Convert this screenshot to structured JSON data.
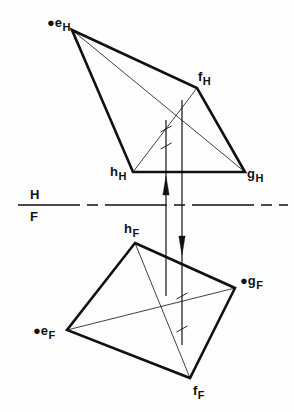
{
  "figure": {
    "kind": "descriptive-geometry-orthographic-projection",
    "background_color": "#fefefe",
    "ink_color": "#111111",
    "fold_line": {
      "upper_label": "H",
      "lower_label": "F",
      "style": "dash-dot",
      "y": 205,
      "x_start": 18,
      "x_end": 288
    },
    "top_view": {
      "name": "horizontal-projection",
      "vertices": [
        {
          "id": "e",
          "label_base": "e",
          "label_sub": "H",
          "marker": "●",
          "x": 72,
          "y": 30,
          "label_x": 47,
          "label_y": 14,
          "has_dot": true
        },
        {
          "id": "f",
          "label_base": "f",
          "label_sub": "H",
          "marker": "",
          "x": 197,
          "y": 88,
          "label_x": 198,
          "label_y": 68,
          "has_dot": false
        },
        {
          "id": "g",
          "label_base": "g",
          "label_sub": "H",
          "marker": "",
          "x": 245,
          "y": 172,
          "label_x": 247,
          "label_y": 165,
          "has_dot": false
        },
        {
          "id": "h",
          "label_base": "h",
          "label_sub": "H",
          "marker": "",
          "x": 133,
          "y": 172,
          "label_x": 110,
          "label_y": 163,
          "has_dot": false
        }
      ],
      "outline_order": [
        "e",
        "f",
        "g",
        "h"
      ],
      "diagonals": [
        [
          "e",
          "g"
        ],
        [
          "f",
          "h"
        ]
      ]
    },
    "front_view": {
      "name": "frontal-projection",
      "vertices": [
        {
          "id": "h",
          "label_base": "h",
          "label_sub": "F",
          "marker": "",
          "x": 135,
          "y": 243,
          "label_x": 124,
          "label_y": 220,
          "has_dot": false
        },
        {
          "id": "g",
          "label_base": "g",
          "label_sub": "F",
          "marker": "●",
          "x": 235,
          "y": 288,
          "label_x": 240,
          "label_y": 272,
          "has_dot": true
        },
        {
          "id": "f",
          "label_base": "f",
          "label_sub": "F",
          "marker": "",
          "x": 190,
          "y": 378,
          "label_x": 193,
          "label_y": 382,
          "has_dot": false
        },
        {
          "id": "e",
          "label_base": "e",
          "label_sub": "F",
          "marker": "●",
          "x": 67,
          "y": 330,
          "label_x": 33,
          "label_y": 322,
          "has_dot": true
        }
      ],
      "outline_order": [
        "h",
        "g",
        "f",
        "e"
      ],
      "diagonals": [
        [
          "h",
          "f"
        ],
        [
          "g",
          "e"
        ]
      ]
    },
    "projectors": [
      {
        "name": "projector-left",
        "x": 166,
        "y_top": 120,
        "y_bottom": 296,
        "arrow": "up",
        "arrow_y": 176
      },
      {
        "name": "projector-right",
        "x": 182,
        "y_top": 100,
        "y_bottom": 345,
        "arrow": "down",
        "arrow_y": 236
      }
    ],
    "tick_marks": [
      {
        "name": "tick-upper-crossing",
        "x": 166,
        "y": 129
      },
      {
        "name": "tick-lower-crossing",
        "x": 166,
        "y": 146
      },
      {
        "name": "tick-front-upper",
        "x": 182,
        "y": 296
      },
      {
        "name": "tick-front-lower",
        "x": 182,
        "y": 329
      }
    ],
    "line_weights": {
      "outline": 2.6,
      "diagonal": 0.8,
      "projector": 1.2,
      "fold": 1.3
    }
  }
}
